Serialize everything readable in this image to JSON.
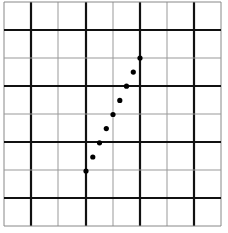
{
  "diagram": {
    "type": "grid-with-dots",
    "grid": {
      "columns": 8,
      "rows": 8,
      "x_lines": [
        4,
        31,
        58,
        86,
        113,
        140,
        167,
        194,
        221
      ],
      "y_lines": [
        2,
        30,
        58,
        86,
        114,
        142,
        170,
        198,
        226
      ],
      "thick_x": [
        31,
        86,
        140,
        194
      ],
      "thick_y": [
        30,
        86,
        142,
        198
      ],
      "thin_color": "#999999",
      "thick_color": "#111111",
      "border_color": "#888888"
    },
    "dots": {
      "color": "#000000",
      "radius": 2.6,
      "points": [
        [
          86,
          171
        ],
        [
          92.8,
          157
        ],
        [
          99.5,
          142.8
        ],
        [
          106.3,
          128.6
        ],
        [
          113,
          114.5
        ],
        [
          119.8,
          100.4
        ],
        [
          126.5,
          86.2
        ],
        [
          133.3,
          72.1
        ],
        [
          140,
          58
        ]
      ]
    }
  }
}
